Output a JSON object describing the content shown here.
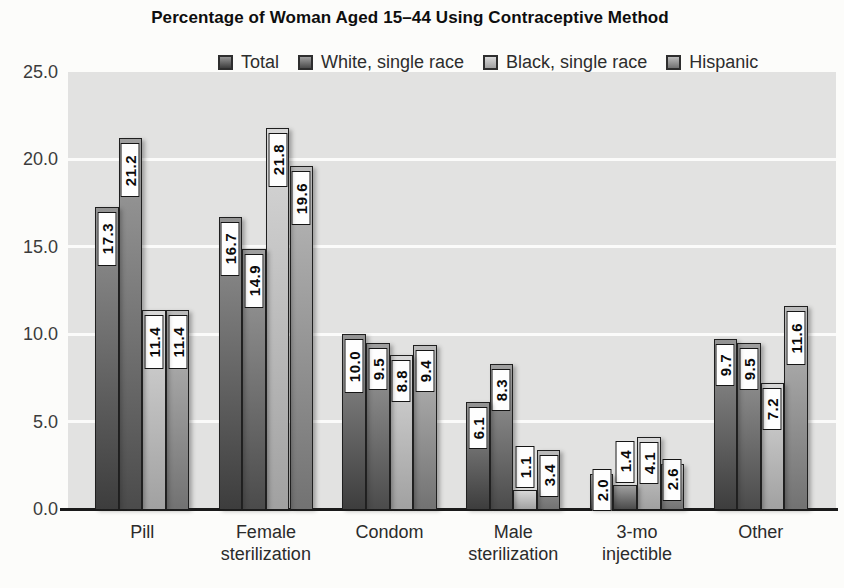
{
  "title": "Percentage of Woman Aged 15–44 Using Contraceptive Method",
  "colors": {
    "plot_bg": "#e2e2e1",
    "gridline": "#fbfbfa",
    "axis_line": "#1a1a1a",
    "bar_border": "#1f1f1f",
    "value_box_bg": "#fefefe",
    "value_box_border": "#151515"
  },
  "chart_data": {
    "type": "bar",
    "title": "Percentage of Woman Aged 15–44 Using Contraceptive Method",
    "categories": [
      "Pill",
      "Female\nsterilization",
      "Condom",
      "Male\nsterilization",
      "3-mo\ninjectible",
      "Other"
    ],
    "series": [
      {
        "name": "Total",
        "values": [
          17.3,
          16.7,
          10.0,
          6.1,
          2.0,
          9.7
        ],
        "color_top": "#949494",
        "color_bottom": "#3d3d3d"
      },
      {
        "name": "White, single race",
        "values": [
          21.2,
          14.9,
          9.5,
          8.3,
          1.4,
          9.5
        ],
        "color_top": "#9f9f9f",
        "color_bottom": "#4b4b4b"
      },
      {
        "name": "Black, single race",
        "values": [
          11.4,
          21.8,
          8.8,
          1.1,
          4.1,
          7.2
        ],
        "color_top": "#d8d8d8",
        "color_bottom": "#a1a1a1"
      },
      {
        "name": "Hispanic",
        "values": [
          11.4,
          19.6,
          9.4,
          3.4,
          2.6,
          11.6
        ],
        "color_top": "#bbbbbb",
        "color_bottom": "#727272"
      }
    ],
    "xlabel": "",
    "ylabel": "",
    "ylim": [
      0,
      25
    ],
    "yticks": [
      {
        "value": 0,
        "label": "0.0"
      },
      {
        "value": 5,
        "label": "5.0"
      },
      {
        "value": 10,
        "label": "10.0"
      },
      {
        "value": 15,
        "label": "15.0"
      },
      {
        "value": 20,
        "label": "20.0"
      },
      {
        "value": 25,
        "label": "25.0"
      }
    ],
    "grid": true,
    "legend_position": "top",
    "value_labels": true
  }
}
